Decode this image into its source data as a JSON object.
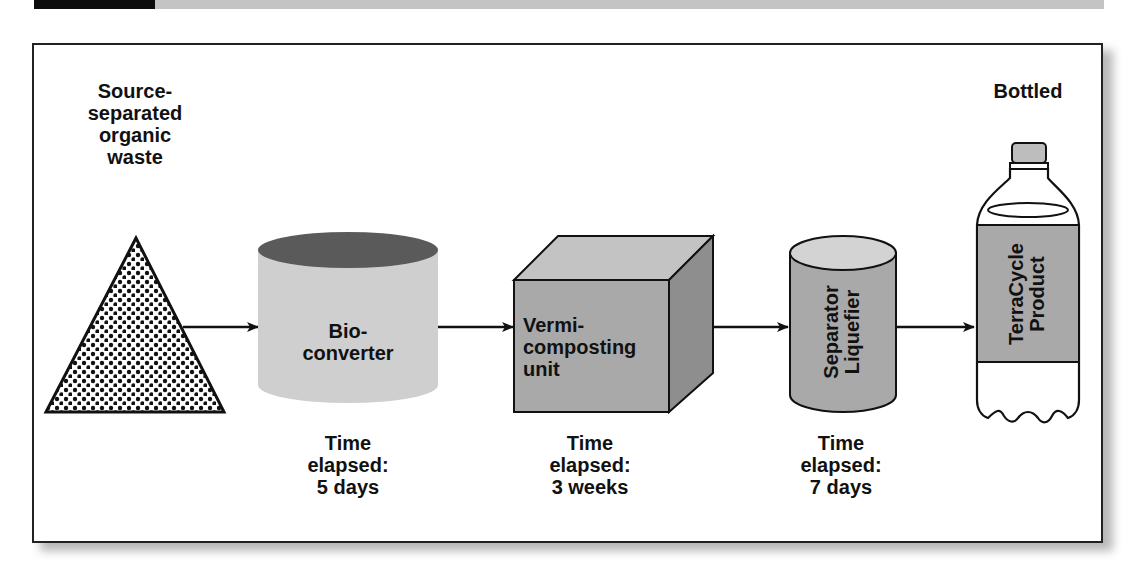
{
  "header": {
    "black_bar_color": "#0c0c0c",
    "gray_bar_color": "#c4c4c4"
  },
  "diagram": {
    "title": "",
    "stages": [
      {
        "id": "input",
        "shape": "triangle-dotted",
        "label": "Source-\nseparated\norganic\nwaste",
        "time": ""
      },
      {
        "id": "bioconverter",
        "shape": "cylinder",
        "label": "Bio-\nconverter",
        "time": "Time\nelapsed:\n5 days"
      },
      {
        "id": "vermicomposting",
        "shape": "cube",
        "label": "Vermi-\ncomposting\nunit",
        "time": "Time\nelapsed:\n3 weeks"
      },
      {
        "id": "separator",
        "shape": "cylinder-tall",
        "label": "Separator\nLiquefier",
        "time": "Time\nelapsed:\n7 days"
      },
      {
        "id": "bottle",
        "shape": "bottle",
        "label": "TerraCycle\nProduct",
        "heading": "Bottled",
        "time": ""
      }
    ],
    "flow": [
      "input",
      "bioconverter",
      "vermicomposting",
      "separator",
      "bottle"
    ],
    "colors": {
      "fill_light": "#cfcfcf",
      "fill_mid": "#a9a9a9",
      "fill_dark": "#5a5a5a",
      "stroke": "#111111"
    }
  }
}
